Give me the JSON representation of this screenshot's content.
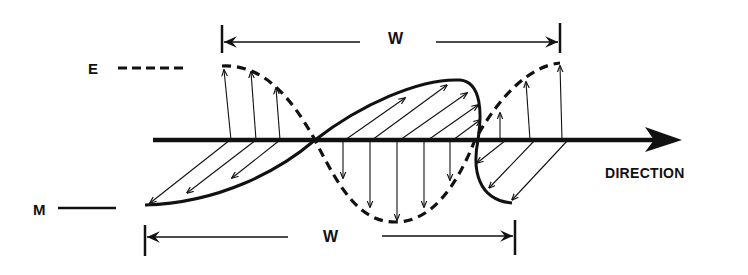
{
  "diagram": {
    "title": "",
    "labels": {
      "electric_field": "E",
      "magnetic_field": "M",
      "wavelength_top": "W",
      "wavelength_bottom": "W",
      "direction": "DIRECTION"
    },
    "legend": [
      {
        "label": "E",
        "line_style": "dashed"
      },
      {
        "label": "M",
        "line_style": "solid"
      }
    ],
    "colors": {
      "ink": "#111111",
      "background": "#ffffff"
    }
  }
}
